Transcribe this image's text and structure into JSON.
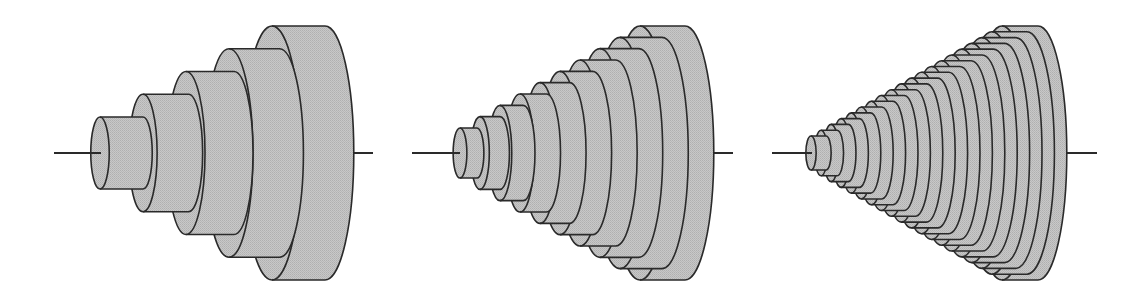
{
  "figure": {
    "colors": {
      "fill": "#c6c6c6",
      "fill_dither": "#b4b4b4",
      "stroke": "#2a2a2a",
      "background": "#ffffff"
    },
    "axis_y": 153,
    "panels": [
      {
        "name": "approximation-5-disks",
        "disk_count": 5,
        "front_center_x": [
          100,
          272
        ],
        "half_height": [
          36,
          127
        ],
        "thickness": [
          43,
          53
        ],
        "axis_left": [
          54,
          101
        ],
        "axis_right": [
          354,
          373
        ]
      },
      {
        "name": "approximation-10-disks",
        "disk_count": 10,
        "front_center_x": [
          460,
          640
        ],
        "half_height": [
          25,
          127
        ],
        "thickness": [
          17,
          45
        ],
        "axis_left": [
          412,
          460
        ],
        "axis_right": [
          714,
          733
        ]
      },
      {
        "name": "approximation-20-disks",
        "disk_count": 20,
        "front_center_x": [
          811,
          1002
        ],
        "half_height": [
          17,
          127
        ],
        "thickness": [
          15,
          36
        ],
        "axis_left": [
          772,
          812
        ],
        "axis_right": [
          1067,
          1097
        ]
      }
    ]
  }
}
